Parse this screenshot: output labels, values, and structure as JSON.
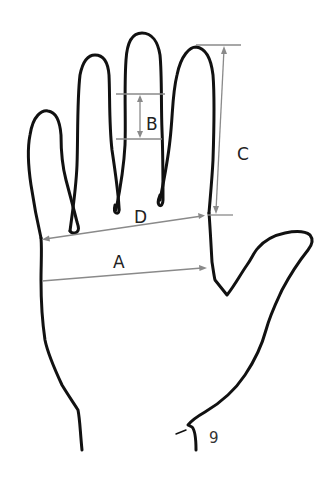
{
  "diagram": {
    "colors": {
      "outline": "#111111",
      "dimension_lines": "#8a8a8a",
      "labels": "#222222",
      "background": "#ffffff"
    },
    "measurements": [
      {
        "id": "A",
        "label": "A",
        "description": "palm width across, from left edge of palm to thumb crotch"
      },
      {
        "id": "B",
        "label": "B",
        "description": "vertical span on middle finger"
      },
      {
        "id": "C",
        "label": "C",
        "description": "index finger length, tip to base"
      },
      {
        "id": "D",
        "label": "D",
        "description": "palm width across knuckles, little finger base to index finger base"
      }
    ],
    "page_number": "9"
  }
}
